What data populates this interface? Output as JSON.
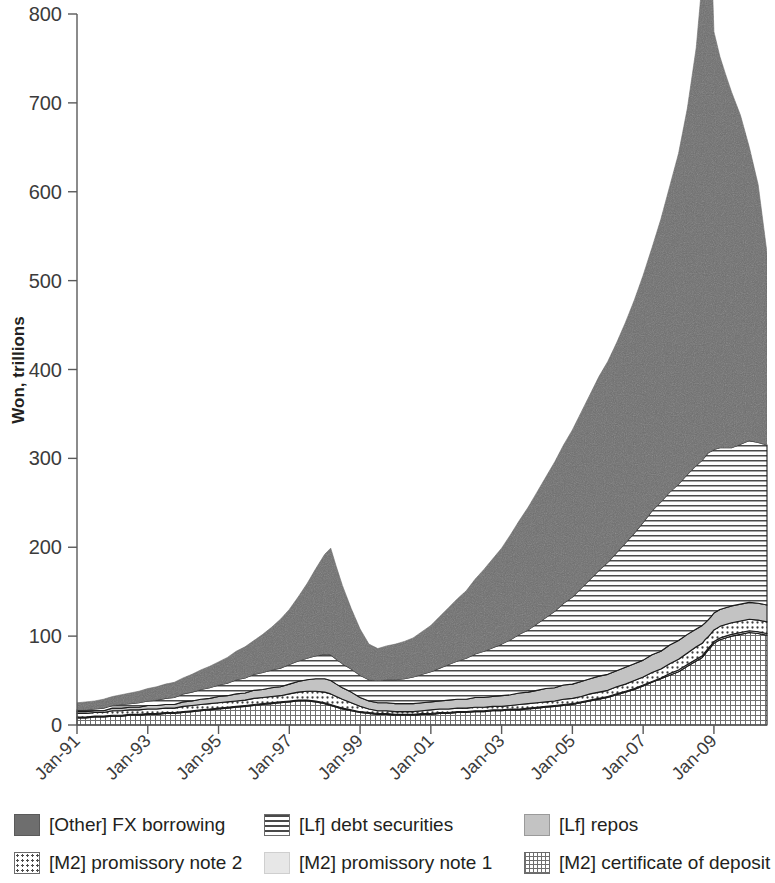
{
  "chart_data": {
    "type": "area",
    "stacked": true,
    "title": "",
    "xlabel": "",
    "ylabel": "Won, trillions",
    "ylim": [
      0,
      800
    ],
    "ytick_labels": [
      "0",
      "100",
      "200",
      "300",
      "400",
      "500",
      "600",
      "700",
      "800"
    ],
    "ytick_values": [
      0,
      100,
      200,
      300,
      400,
      500,
      600,
      700,
      800
    ],
    "xtick_labels": [
      "Jan-91",
      "Jan-93",
      "Jan-95",
      "Jan-97",
      "Jan-99",
      "Jan-01",
      "Jan-03",
      "Jan-05",
      "Jan-07",
      "Jan-09"
    ],
    "xtick_values": [
      1991.0,
      1993.0,
      1995.0,
      1997.0,
      1999.0,
      2001.0,
      2003.0,
      2005.0,
      2007.0,
      2009.0
    ],
    "xlim": [
      1991.0,
      2010.5
    ],
    "grid": false,
    "legend_position": "bottom",
    "x": [
      1991.0,
      1991.25,
      1991.5,
      1991.75,
      1992.0,
      1992.25,
      1992.5,
      1992.75,
      1993.0,
      1993.25,
      1993.5,
      1993.75,
      1994.0,
      1994.25,
      1994.5,
      1994.75,
      1995.0,
      1995.25,
      1995.5,
      1995.75,
      1996.0,
      1996.25,
      1996.5,
      1996.75,
      1997.0,
      1997.25,
      1997.5,
      1997.75,
      1998.0,
      1998.17,
      1998.33,
      1998.5,
      1998.75,
      1999.0,
      1999.25,
      1999.5,
      1999.75,
      2000.0,
      2000.25,
      2000.5,
      2000.75,
      2001.0,
      2001.25,
      2001.5,
      2001.75,
      2002.0,
      2002.25,
      2002.5,
      2002.75,
      2003.0,
      2003.25,
      2003.5,
      2003.75,
      2004.0,
      2004.25,
      2004.5,
      2004.75,
      2005.0,
      2005.25,
      2005.5,
      2005.75,
      2006.0,
      2006.25,
      2006.5,
      2006.75,
      2007.0,
      2007.25,
      2007.5,
      2007.75,
      2008.0,
      2008.25,
      2008.5,
      2008.67,
      2008.75,
      2008.83,
      2008.92,
      2009.0,
      2009.17,
      2009.33,
      2009.5,
      2009.75,
      2010.0,
      2010.25,
      2010.5
    ],
    "series": [
      {
        "name": "[M2] certificate of deposit",
        "key": "cd",
        "color": "#ffffff",
        "pattern": "grid",
        "values": [
          8,
          8,
          9,
          9,
          10,
          10,
          11,
          11,
          12,
          12,
          13,
          13,
          14,
          15,
          16,
          17,
          18,
          19,
          20,
          21,
          22,
          23,
          24,
          25,
          26,
          27,
          27,
          26,
          24,
          22,
          20,
          18,
          16,
          14,
          13,
          12,
          12,
          11,
          11,
          11,
          12,
          12,
          13,
          13,
          14,
          14,
          15,
          15,
          16,
          16,
          17,
          17,
          18,
          19,
          20,
          21,
          22,
          23,
          25,
          27,
          29,
          31,
          34,
          37,
          40,
          44,
          48,
          52,
          56,
          60,
          66,
          72,
          76,
          80,
          84,
          88,
          92,
          96,
          98,
          100,
          102,
          104,
          103,
          101
        ]
      },
      {
        "name": "[M2] promissory note 1",
        "key": "note1",
        "color": "#e7e7e7",
        "pattern": "solid-light",
        "values": [
          1,
          1,
          1,
          1,
          1,
          1,
          1,
          1,
          1,
          1,
          1,
          1,
          1,
          1,
          1,
          1,
          1,
          1,
          1,
          1,
          1,
          1,
          1,
          1,
          1,
          1,
          1,
          1,
          1,
          1,
          1,
          1,
          1,
          1,
          1,
          1,
          1,
          1,
          1,
          1,
          1,
          1,
          1,
          1,
          1,
          1,
          1,
          1,
          1,
          1,
          1,
          1,
          1,
          1,
          1,
          1,
          1,
          1,
          1,
          1,
          1,
          1,
          1,
          1,
          1,
          1,
          1,
          1,
          2,
          2,
          2,
          2,
          2,
          2,
          2,
          2,
          2,
          2,
          2,
          2,
          2,
          2,
          2,
          2
        ]
      },
      {
        "name": "[M2] promissory note 2",
        "key": "note2",
        "color": "#ffffff",
        "pattern": "dots",
        "values": [
          4,
          4,
          4,
          4,
          5,
          5,
          5,
          5,
          5,
          5,
          5,
          5,
          6,
          6,
          6,
          6,
          6,
          6,
          6,
          6,
          7,
          7,
          7,
          7,
          8,
          9,
          10,
          11,
          12,
          12,
          11,
          10,
          8,
          6,
          4,
          3,
          3,
          3,
          3,
          3,
          3,
          4,
          4,
          4,
          4,
          4,
          4,
          4,
          4,
          4,
          4,
          5,
          5,
          5,
          5,
          5,
          6,
          6,
          6,
          7,
          7,
          7,
          8,
          8,
          9,
          9,
          10,
          10,
          11,
          12,
          13,
          14,
          14,
          14,
          13,
          13,
          13,
          13,
          13,
          13,
          13,
          13,
          13,
          13
        ]
      },
      {
        "name": "[Lf] repos",
        "key": "repos",
        "color": "#c3c3c3",
        "pattern": "solid-mid",
        "values": [
          2,
          2,
          2,
          2,
          3,
          3,
          3,
          3,
          4,
          4,
          4,
          4,
          5,
          5,
          6,
          6,
          7,
          7,
          8,
          8,
          9,
          9,
          10,
          10,
          11,
          12,
          13,
          14,
          15,
          15,
          14,
          13,
          12,
          10,
          9,
          9,
          9,
          9,
          9,
          9,
          9,
          9,
          9,
          10,
          10,
          10,
          11,
          11,
          11,
          12,
          12,
          13,
          13,
          14,
          15,
          15,
          16,
          16,
          17,
          17,
          18,
          18,
          18,
          19,
          19,
          19,
          20,
          20,
          21,
          21,
          21,
          20,
          20,
          19,
          19,
          19,
          19,
          19,
          19,
          19,
          19,
          19,
          19,
          19
        ]
      },
      {
        "name": "[Lf] debt securities",
        "key": "debt",
        "color": "#ffffff",
        "pattern": "hlines",
        "values": [
          2,
          2,
          2,
          3,
          3,
          4,
          4,
          5,
          5,
          6,
          7,
          8,
          9,
          10,
          11,
          12,
          13,
          14,
          16,
          17,
          18,
          19,
          20,
          21,
          22,
          23,
          24,
          26,
          28,
          29,
          28,
          27,
          26,
          25,
          24,
          25,
          26,
          27,
          28,
          30,
          32,
          34,
          37,
          40,
          43,
          46,
          49,
          52,
          55,
          58,
          62,
          66,
          70,
          75,
          80,
          86,
          92,
          98,
          105,
          112,
          119,
          126,
          133,
          140,
          147,
          155,
          162,
          168,
          172,
          176,
          180,
          184,
          186,
          187,
          188,
          186,
          184,
          182,
          180,
          178,
          180,
          182,
          181,
          180
        ]
      },
      {
        "name": "[Other] FX borrowing",
        "key": "fx",
        "color": "#6e6e6e",
        "pattern": "solid-dark",
        "values": [
          8,
          9,
          9,
          10,
          10,
          11,
          12,
          13,
          14,
          15,
          16,
          17,
          18,
          20,
          22,
          24,
          26,
          29,
          32,
          35,
          38,
          43,
          48,
          55,
          62,
          72,
          84,
          98,
          112,
          120,
          104,
          88,
          68,
          52,
          40,
          36,
          38,
          40,
          42,
          44,
          48,
          52,
          58,
          64,
          70,
          76,
          84,
          92,
          100,
          108,
          118,
          128,
          138,
          148,
          158,
          168,
          178,
          188,
          198,
          208,
          218,
          226,
          236,
          248,
          262,
          278,
          296,
          318,
          344,
          372,
          412,
          470,
          540,
          600,
          540,
          570,
          470,
          440,
          420,
          400,
          370,
          330,
          290,
          216
        ]
      }
    ],
    "totals_note": "Stacked area; peak total approximately 700 in late 2008"
  },
  "axis": {
    "y_label": "Won, trillions"
  },
  "legend": {
    "items": [
      {
        "key": "fx",
        "label": "[Other] FX borrowing"
      },
      {
        "key": "debt",
        "label": "[Lf] debt securities"
      },
      {
        "key": "repos",
        "label": "[Lf] repos"
      },
      {
        "key": "note2",
        "label": "[M2] promissory note 2"
      },
      {
        "key": "note1",
        "label": "[M2] promissory note 1"
      },
      {
        "key": "cd",
        "label": "[M2] certificate of deposit"
      }
    ]
  }
}
